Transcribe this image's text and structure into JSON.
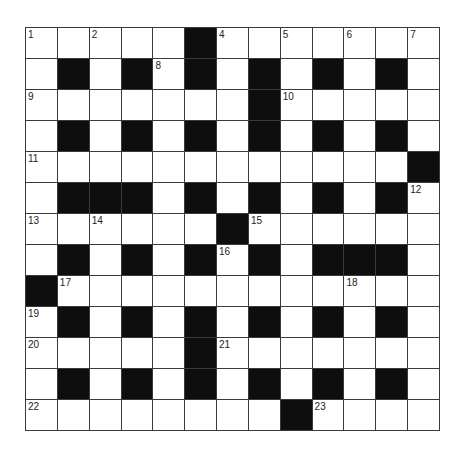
{
  "puzzle": {
    "rows": 13,
    "cols": 13,
    "colors": {
      "black": "#0e0e0e",
      "white": "#ffffff",
      "line": "#3a3a3a"
    },
    "layout": [
      ".....#.......",
      ".#.#.#.#.#.#.",
      ".......#.....",
      ".#.#.#.#.#.#.",
      "............#",
      ".###.#.#.#.#.",
      "......#......",
      ".#.#.#.#.###.",
      "#............",
      ".#.#.#.#.#.#.",
      ".....#.......",
      ".#.#.#.#.#.#.",
      "........#...."
    ],
    "numbers": [
      {
        "r": 0,
        "c": 0,
        "n": "1"
      },
      {
        "r": 0,
        "c": 2,
        "n": "2"
      },
      {
        "r": 0,
        "c": 5,
        "n": "3"
      },
      {
        "r": 0,
        "c": 6,
        "n": "4"
      },
      {
        "r": 0,
        "c": 8,
        "n": "5"
      },
      {
        "r": 0,
        "c": 10,
        "n": "6"
      },
      {
        "r": 0,
        "c": 12,
        "n": "7"
      },
      {
        "r": 1,
        "c": 4,
        "n": "8"
      },
      {
        "r": 2,
        "c": 0,
        "n": "9"
      },
      {
        "r": 2,
        "c": 8,
        "n": "10"
      },
      {
        "r": 4,
        "c": 0,
        "n": "11"
      },
      {
        "r": 5,
        "c": 12,
        "n": "12"
      },
      {
        "r": 6,
        "c": 0,
        "n": "13"
      },
      {
        "r": 6,
        "c": 2,
        "n": "14"
      },
      {
        "r": 6,
        "c": 7,
        "n": "15"
      },
      {
        "r": 7,
        "c": 6,
        "n": "16"
      },
      {
        "r": 8,
        "c": 1,
        "n": "17"
      },
      {
        "r": 8,
        "c": 10,
        "n": "18"
      },
      {
        "r": 9,
        "c": 0,
        "n": "19"
      },
      {
        "r": 10,
        "c": 0,
        "n": "20"
      },
      {
        "r": 10,
        "c": 6,
        "n": "21"
      },
      {
        "r": 12,
        "c": 0,
        "n": "22"
      },
      {
        "r": 12,
        "c": 9,
        "n": "23"
      }
    ]
  }
}
